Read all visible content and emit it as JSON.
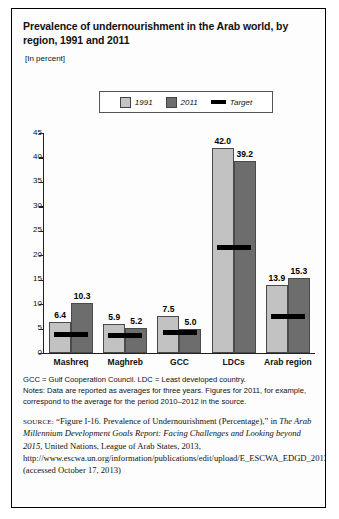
{
  "figure": {
    "title": "Prevalence of undernourishment in the Arab world, by region, 1991 and 2011",
    "units": "[In percent]"
  },
  "legend": {
    "items": [
      {
        "label": "1991",
        "swatch": "light-gray-square",
        "color": "#c2c2c2"
      },
      {
        "label": "2011",
        "swatch": "dark-gray-square",
        "color": "#6d6d6d"
      },
      {
        "label": "Target",
        "swatch": "black-line",
        "color": "#000000"
      }
    ]
  },
  "chart_data": {
    "type": "bar",
    "title": "Prevalence of undernourishment in the Arab world, by region, 1991 and 2011",
    "xlabel": "",
    "ylabel": "",
    "ylim": [
      0,
      45
    ],
    "yticks": [
      0,
      5,
      10,
      15,
      20,
      25,
      30,
      35,
      40,
      45
    ],
    "grid": false,
    "legend_position": "top",
    "units": "percent",
    "categories": [
      "Mashreq",
      "Maghreb",
      "GCC",
      "LDCs",
      "Arab region"
    ],
    "series": [
      {
        "name": "1991",
        "color": "#c2c2c2",
        "values": [
          6.4,
          5.9,
          7.5,
          42.0,
          13.9
        ]
      },
      {
        "name": "2011",
        "color": "#6d6d6d",
        "values": [
          10.3,
          5.2,
          5.0,
          39.2,
          15.3
        ]
      },
      {
        "name": "Target",
        "color": "#000000",
        "values": [
          3.2,
          3.0,
          3.75,
          21.0,
          6.9
        ]
      }
    ]
  },
  "notes": {
    "abbrev": "GCC = Gulf Cooperation Council. LDC = Least developed country.",
    "line1": "Notes: Data are reported as averages for three years. Figures for 2011, for example,",
    "line2": "correspond to the average for the period 2010–2012 in the source."
  },
  "source": {
    "kicker": "SOURCE:",
    "part1": " “Figure I-16. Prevalence of Undernourishment (Percentage),” in ",
    "italic": "The Arab Millennium Development Goals Report: Facing Challenges and Looking beyond 2015",
    "part2": ", United Nations, League of Arab States, 2013, http://www.escwa.un.org/information/publications/edit/upload/E_ESCWA_EDGD_2013_1_E.pdf (accessed October 17, 2013)"
  }
}
